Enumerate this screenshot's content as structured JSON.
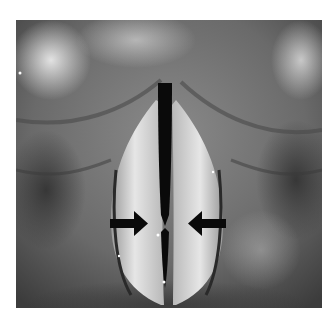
{
  "image": {
    "description": "Grayscale laryngoscopic view of the vocal folds with two arrows pointing to the midline",
    "annotations": [
      {
        "type": "arrow",
        "direction": "right",
        "name": "left-arrow"
      },
      {
        "type": "arrow",
        "direction": "left",
        "name": "right-arrow"
      }
    ],
    "colors": {
      "background": "#ffffff",
      "tissue_dark": "#3a3a3a",
      "tissue_mid": "#7a7a7a",
      "tissue_light": "#d8d8d8",
      "glottis": "#0a0a0a",
      "arrow": "#0a0a0a"
    }
  }
}
